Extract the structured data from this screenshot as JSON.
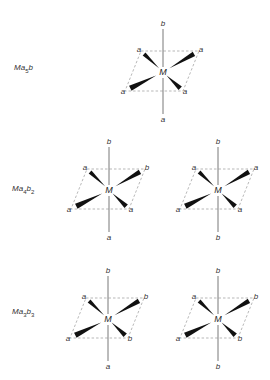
{
  "diagram": {
    "center_label": "M",
    "rows": [
      {
        "formula": {
          "prefix": "M",
          "a": "a",
          "a_sub": "5",
          "b": "b",
          "b_sub": ""
        },
        "label_pos": [
          14,
          64
        ],
        "structures": [
          {
            "center": [
              163,
              72
            ],
            "top": "b",
            "bottom": "a",
            "tl": "a",
            "tr": "a",
            "bl": "a",
            "br": "a"
          }
        ]
      },
      {
        "formula": {
          "prefix": "M",
          "a": "a",
          "a_sub": "4",
          "b": "b",
          "b_sub": "2"
        },
        "label_pos": [
          12,
          185
        ],
        "structures": [
          {
            "center": [
              109,
              190
            ],
            "top": "b",
            "bottom": "a",
            "tl": "a",
            "tr": "b",
            "bl": "a",
            "br": "a"
          },
          {
            "center": [
              218,
              190
            ],
            "top": "b",
            "bottom": "b",
            "tl": "a",
            "tr": "a",
            "bl": "a",
            "br": "a"
          }
        ]
      },
      {
        "formula": {
          "prefix": "M",
          "a": "a",
          "a_sub": "3",
          "b": "b",
          "b_sub": "3"
        },
        "label_pos": [
          12,
          308
        ],
        "structures": [
          {
            "center": [
              108,
              319
            ],
            "top": "b",
            "bottom": "a",
            "tl": "a",
            "tr": "b",
            "bl": "a",
            "br": "b"
          },
          {
            "center": [
              218,
              319
            ],
            "top": "b",
            "bottom": "b",
            "tl": "a",
            "tr": "b",
            "bl": "a",
            "br": "b"
          }
        ]
      }
    ],
    "colors": {
      "line": "#555555",
      "wedge": "#111111",
      "dash": "#888888",
      "text": "#333333"
    }
  }
}
